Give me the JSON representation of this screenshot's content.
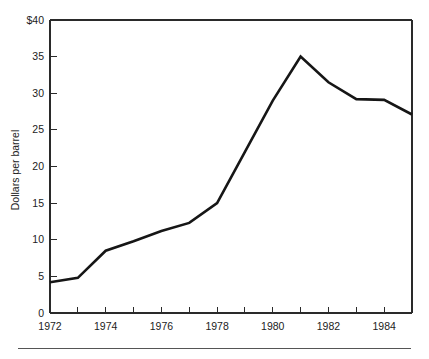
{
  "chart_data": {
    "type": "line",
    "title": "",
    "xlabel": "",
    "ylabel": "Dollars per barrel",
    "x": [
      1972,
      1973,
      1974,
      1975,
      1976,
      1977,
      1978,
      1979,
      1980,
      1981,
      1982,
      1983,
      1984,
      1985
    ],
    "values": [
      4.2,
      4.8,
      8.5,
      9.8,
      11.2,
      12.3,
      15.0,
      22.0,
      29.0,
      35.0,
      31.5,
      29.2,
      29.1,
      27.1
    ],
    "series": [
      {
        "name": "Dollars per barrel",
        "values": [
          4.2,
          4.8,
          8.5,
          9.8,
          11.2,
          12.3,
          15.0,
          22.0,
          29.0,
          35.0,
          31.5,
          29.2,
          29.1,
          27.1
        ]
      }
    ],
    "xlim": [
      1972,
      1985
    ],
    "ylim": [
      0,
      40
    ],
    "y_ticks": [
      0,
      5,
      10,
      15,
      20,
      25,
      30,
      35,
      40
    ],
    "y_tick_labels": [
      "0",
      "5",
      "10",
      "15",
      "20",
      "25",
      "30",
      "35",
      "$40"
    ],
    "x_ticks": [
      1972,
      1973,
      1974,
      1975,
      1976,
      1977,
      1978,
      1979,
      1980,
      1981,
      1982,
      1983,
      1984,
      1985
    ],
    "x_tick_labels": [
      "1972",
      "",
      "1974",
      "",
      "1976",
      "",
      "1978",
      "",
      "1980",
      "",
      "1982",
      "",
      "1984",
      ""
    ],
    "grid": false,
    "legend": "none",
    "line_color": "#161616",
    "axis_color": "#2a2a2a",
    "background": "#ffffff"
  },
  "figure": {
    "footer_rule_color": "#555555"
  }
}
